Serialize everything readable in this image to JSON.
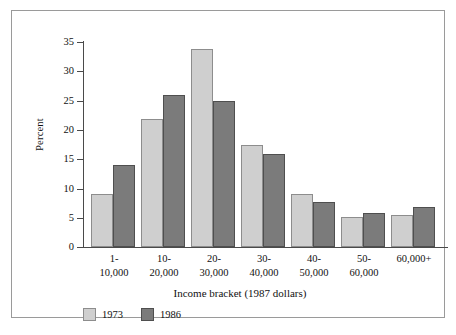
{
  "chart_data": {
    "type": "bar",
    "title": "",
    "subtitle": "",
    "xlabel": "Income bracket (1987 dollars)",
    "ylabel": "Percent",
    "categories": [
      "1-\n10,000",
      "10-\n20,000",
      "20-\n30,000",
      "30-\n40,000",
      "40-\n50,000",
      "50-\n60,000",
      "60,000+"
    ],
    "category_lines": [
      [
        "1-",
        "10,000"
      ],
      [
        "10-",
        "20,000"
      ],
      [
        "20-",
        "30,000"
      ],
      [
        "30-",
        "40,000"
      ],
      [
        "40-",
        "50,000"
      ],
      [
        "50-",
        "60,000"
      ],
      [
        "60,000+",
        ""
      ]
    ],
    "series": [
      {
        "name": "1973",
        "color": "#cfcfcf",
        "values": [
          9.0,
          21.9,
          33.8,
          17.4,
          9.1,
          5.1,
          5.5
        ]
      },
      {
        "name": "1986",
        "color": "#7b7b7b",
        "values": [
          14.0,
          26.0,
          25.0,
          15.9,
          7.7,
          5.8,
          6.8
        ]
      }
    ],
    "ylim": [
      0,
      35
    ],
    "yticks": [
      0,
      5,
      10,
      15,
      20,
      25,
      30,
      35
    ],
    "ytick_labels": [
      "0",
      "5",
      "10",
      "15",
      "20",
      "25",
      "30",
      "35"
    ],
    "grid": false,
    "legend_position": "below-left",
    "legend_entries": [
      "1973",
      "1986"
    ]
  },
  "figure": {
    "border_color": "#9a9a9a",
    "background": "#ffffff",
    "axis_color": "#4a4a4a"
  }
}
